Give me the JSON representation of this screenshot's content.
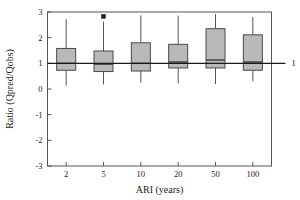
{
  "chart_data": {
    "type": "boxplot",
    "title": "",
    "xlabel": "ARI (years)",
    "ylabel": "Ratio (Qpred/Qobs)",
    "categories": [
      "2",
      "5",
      "10",
      "20",
      "50",
      "100"
    ],
    "xtick_labels": [
      "2",
      "5",
      "10",
      "20",
      "50",
      "100"
    ],
    "ytick_labels": [
      "3",
      "2",
      "1",
      "0",
      "-1",
      "-2",
      "-3"
    ],
    "ytick_values": [
      3,
      2,
      1,
      0,
      -1,
      -2,
      -3
    ],
    "ylim": [
      -3,
      3
    ],
    "grid": false,
    "legend": false,
    "reference_line": {
      "value": 1,
      "label": "1",
      "extends_past_axis": true
    },
    "box_fill_color": "#b9b9b9",
    "box_edge_color": "#4a4a4a",
    "boxes": [
      {
        "category": "2",
        "whisker_low": 0.13,
        "q1": 0.73,
        "median": 1.0,
        "q3": 1.58,
        "whisker_high": 2.72,
        "outliers": []
      },
      {
        "category": "5",
        "whisker_low": 0.18,
        "q1": 0.68,
        "median": 0.97,
        "q3": 1.48,
        "whisker_high": 2.62,
        "outliers": [
          2.83
        ]
      },
      {
        "category": "10",
        "whisker_low": 0.25,
        "q1": 0.7,
        "median": 1.0,
        "q3": 1.8,
        "whisker_high": 2.87,
        "outliers": []
      },
      {
        "category": "20",
        "whisker_low": 0.22,
        "q1": 0.82,
        "median": 1.05,
        "q3": 1.74,
        "whisker_high": 2.86,
        "outliers": []
      },
      {
        "category": "50",
        "whisker_low": 0.19,
        "q1": 0.82,
        "median": 1.13,
        "q3": 2.35,
        "whisker_high": 2.92,
        "outliers": []
      },
      {
        "category": "100",
        "whisker_low": 0.3,
        "q1": 0.73,
        "median": 1.05,
        "q3": 2.11,
        "whisker_high": 2.8,
        "outliers": []
      }
    ]
  }
}
